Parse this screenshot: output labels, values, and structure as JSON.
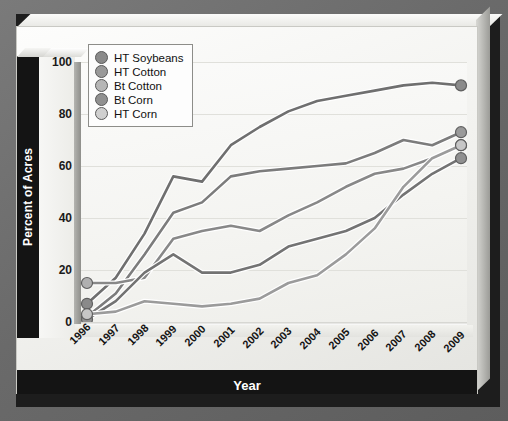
{
  "chart_data": {
    "type": "line",
    "title": "",
    "xlabel": "Year",
    "ylabel": "Percent of Acres",
    "x": [
      "1996",
      "1997",
      "1998",
      "1999",
      "2000",
      "2001",
      "2002",
      "2003",
      "2004",
      "2005",
      "2006",
      "2007",
      "2008",
      "2009"
    ],
    "xlim": [
      1996,
      2009
    ],
    "ylim": [
      0,
      100
    ],
    "yticks": [
      0,
      20,
      40,
      60,
      80,
      100
    ],
    "grid": true,
    "legend_position": "top-left",
    "series": [
      {
        "name": "HT Soybeans",
        "color": "#6f6f6f",
        "marker_color": "#8a8a8a",
        "values": [
          7,
          17,
          34,
          56,
          54,
          68,
          75,
          81,
          85,
          87,
          89,
          91,
          92,
          91
        ]
      },
      {
        "name": "HT Cotton",
        "color": "#7c7c7c",
        "marker_color": "#9a9a9a",
        "values": [
          2,
          11,
          26,
          42,
          46,
          56,
          58,
          59,
          60,
          61,
          65,
          70,
          68,
          73
        ]
      },
      {
        "name": "Bt Cotton",
        "color": "#888888",
        "marker_color": "#b0b0b0",
        "values": [
          15,
          15,
          17,
          32,
          35,
          37,
          35,
          41,
          46,
          52,
          57,
          59,
          63,
          68
        ]
      },
      {
        "name": "Bt Corn",
        "color": "#737373",
        "marker_color": "#909090",
        "values": [
          1,
          8,
          19,
          26,
          19,
          19,
          22,
          29,
          32,
          35,
          40,
          49,
          57,
          63
        ]
      },
      {
        "name": "HT Corn",
        "color": "#9b9b9b",
        "marker_color": "#c6c6c6",
        "values": [
          3,
          4,
          8,
          7,
          6,
          7,
          9,
          15,
          18,
          26,
          36,
          52,
          63,
          68
        ]
      }
    ]
  },
  "axes": {
    "y_title": "Percent of Acres",
    "x_title": "Year",
    "y_tick_labels": [
      "0",
      "20",
      "40",
      "60",
      "80",
      "100"
    ],
    "x_tick_labels": [
      "1996",
      "1997",
      "1998",
      "1999",
      "2000",
      "2001",
      "2002",
      "2003",
      "2004",
      "2005",
      "2006",
      "2007",
      "2008",
      "2009"
    ]
  },
  "legend": {
    "items": [
      {
        "label": "HT Soybeans",
        "swatch": "#8a8a8a"
      },
      {
        "label": "HT Cotton",
        "swatch": "#9a9a9a"
      },
      {
        "label": "Bt Cotton",
        "swatch": "#b6b6b6"
      },
      {
        "label": "Bt Corn",
        "swatch": "#909090"
      },
      {
        "label": "HT Corn",
        "swatch": "#cfcfcf"
      }
    ]
  },
  "theme": {
    "backdrop": "#6e6e6e",
    "panel": "#f4f4f1",
    "axis_band": "#141414",
    "axis_text": "#ffffff",
    "grid": "#e0e0db"
  }
}
